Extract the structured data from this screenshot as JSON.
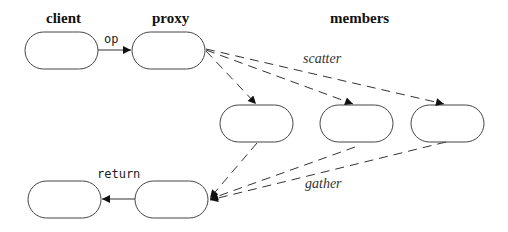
{
  "headers": {
    "client": "client",
    "proxy": "proxy",
    "members": "members"
  },
  "edge_labels": {
    "op": "op",
    "scatter": "scatter",
    "gather": "gather",
    "return": "return"
  },
  "nodes": [
    {
      "id": "client",
      "x": 25,
      "y": 32,
      "w": 73,
      "h": 37
    },
    {
      "id": "proxy",
      "x": 132,
      "y": 32,
      "w": 73,
      "h": 37
    },
    {
      "id": "member-1",
      "x": 220,
      "y": 105,
      "w": 73,
      "h": 37
    },
    {
      "id": "member-2",
      "x": 320,
      "y": 105,
      "w": 73,
      "h": 37
    },
    {
      "id": "member-3",
      "x": 411,
      "y": 105,
      "w": 73,
      "h": 37
    },
    {
      "id": "client-result",
      "x": 28,
      "y": 181,
      "w": 73,
      "h": 37
    },
    {
      "id": "proxy-result",
      "x": 135,
      "y": 181,
      "w": 73,
      "h": 37
    }
  ],
  "colors": {
    "stroke": "#444444",
    "background": "#ffffff"
  }
}
